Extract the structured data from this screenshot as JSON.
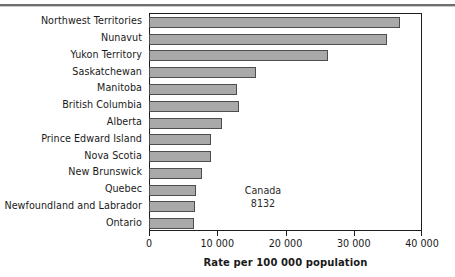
{
  "chart_data": {
    "type": "bar",
    "orientation": "horizontal",
    "title": "",
    "xlabel": "Rate per 100 000 population",
    "ylabel": "",
    "xlim": [
      0,
      40000
    ],
    "xticks": [
      0,
      10000,
      20000,
      30000,
      40000
    ],
    "xtick_labels": [
      "0",
      "10 000",
      "20 000",
      "30 000",
      "40 000"
    ],
    "grid": false,
    "legend": "none",
    "categories": [
      "Northwest Territories",
      "Nunavut",
      "Yukon Territory",
      "Saskatchewan",
      "Manitoba",
      "British Columbia",
      "Alberta",
      "Prince Edward Island",
      "Nova Scotia",
      "New Brunswick",
      "Quebec",
      "Newfoundland and Labrador",
      "Ontario"
    ],
    "values": [
      36700,
      34700,
      26100,
      15600,
      12800,
      13000,
      10500,
      9000,
      9000,
      7600,
      6700,
      6600,
      6500
    ],
    "annotations": [
      {
        "label": "Canada",
        "value": "8132"
      }
    ],
    "bar_color": "#a9a9a9",
    "bar_edge_color": "#4d4d4d",
    "axis_color": "#1d1d1d"
  }
}
